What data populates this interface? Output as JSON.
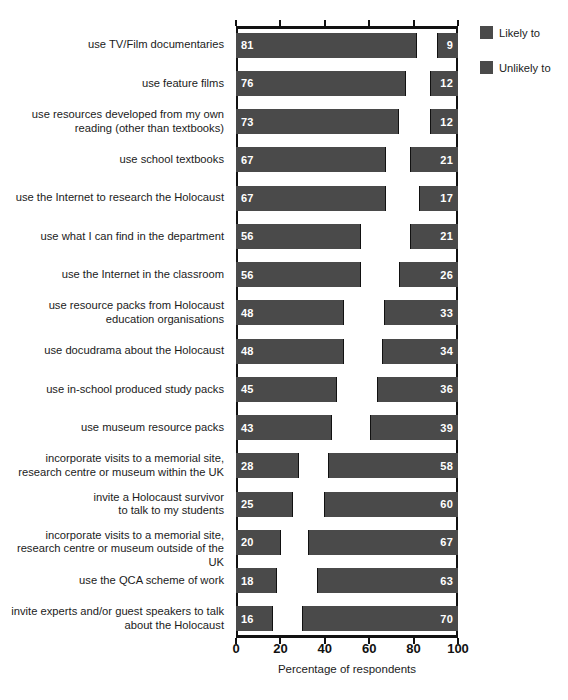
{
  "chart_data": {
    "type": "bar",
    "title": "",
    "subtitle": "",
    "xlabel": "Percentage of respondents",
    "ylabel": "",
    "xlim": [
      0,
      100
    ],
    "xticks": [
      0,
      20,
      40,
      60,
      80,
      100
    ],
    "grid": false,
    "orientation": "horizontal",
    "stacked": true,
    "legend_position": "right",
    "colors": {
      "likely": "#4a4a4a",
      "unlikely": "#4a4a4a",
      "neutral": "#ffffff",
      "axis": "#111111",
      "text": "#1b1b1b",
      "value_label": "#ffffff"
    },
    "legend": [
      {
        "label": "Likely to",
        "color": "#4a4a4a"
      },
      {
        "label": "Unlikely to",
        "color": "#4a4a4a"
      }
    ],
    "series": [
      {
        "name": "Likely to",
        "values": [
          81,
          76,
          73,
          67,
          67,
          56,
          56,
          48,
          48,
          45,
          43,
          28,
          25,
          20,
          18,
          16
        ]
      },
      {
        "name": "Unlikely to",
        "values": [
          9,
          12,
          12,
          21,
          17,
          21,
          26,
          33,
          34,
          36,
          39,
          58,
          60,
          67,
          63,
          70
        ]
      }
    ],
    "categories": [
      "use TV/Film documentaries",
      "use feature films",
      "use resources developed from my own reading (other than textbooks)",
      "use school textbooks",
      "use the Internet to research the Holocaust",
      "use what I can find in the department",
      "use the Internet in the classroom",
      "use resource packs from Holocaust education organisations",
      "use docudrama about the Holocaust",
      "use in-school produced study packs",
      "use museum resource packs",
      "incorporate visits to a memorial site, research centre or museum within the UK",
      "invite a Holocaust survivor to talk to my students",
      "incorporate visits to a memorial site, research centre or museum outside of the UK",
      "use the QCA scheme of work",
      "invite experts and/or guest speakers to talk about the Holocaust"
    ],
    "category_lines": [
      [
        "use TV/Film documentaries"
      ],
      [
        "use feature films"
      ],
      [
        "use resources developed from my own",
        "reading (other than textbooks)"
      ],
      [
        "use school textbooks"
      ],
      [
        "use the Internet to research the Holocaust"
      ],
      [
        "use what I can find in the department"
      ],
      [
        "use the Internet in the classroom"
      ],
      [
        "use resource packs from Holocaust",
        "education organisations"
      ],
      [
        "use docudrama about the Holocaust"
      ],
      [
        "use in-school produced study packs"
      ],
      [
        "use museum resource packs"
      ],
      [
        "incorporate visits to a memorial site,",
        "research centre or museum within the UK"
      ],
      [
        "invite a Holocaust survivor",
        "to talk to my students"
      ],
      [
        "incorporate visits to a memorial site,",
        "research centre or museum outside of the UK"
      ],
      [
        "use the QCA scheme of work"
      ],
      [
        "invite experts and/or guest speakers to talk",
        "about the Holocaust"
      ]
    ]
  }
}
